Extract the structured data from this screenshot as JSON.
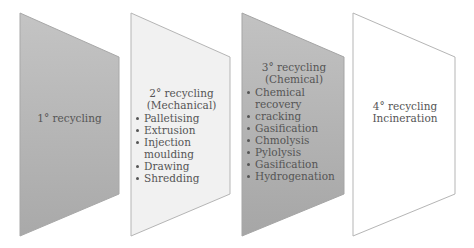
{
  "diagram": {
    "panels": [
      {
        "id": "primary",
        "title_lines": [
          "1° recycling"
        ],
        "items": [],
        "fill": "#b9b9b9",
        "stroke": "#a8a8a8"
      },
      {
        "id": "secondary",
        "title_lines": [
          "2° recycling",
          "(Mechanical)"
        ],
        "items": [
          "Palletising",
          "Extrusion",
          "Injection moulding",
          "Drawing",
          "Shredding"
        ],
        "fill": "#f1f1f1",
        "stroke": "#b5b5b5"
      },
      {
        "id": "tertiary",
        "title_lines": [
          "3° recycling",
          "(Chemical)"
        ],
        "items": [
          "Chemical recovery",
          "cracking",
          "Gasification",
          "Chmolysis",
          "Pylolysis",
          "Gasification",
          "Hydrogenation"
        ],
        "fill": "#b4b4b4",
        "stroke": "#a5a5a5"
      },
      {
        "id": "quaternary",
        "title_lines": [
          "4° recycling",
          "Incineration"
        ],
        "items": [],
        "fill": "#ffffff",
        "stroke": "#b5b5b5"
      }
    ]
  }
}
